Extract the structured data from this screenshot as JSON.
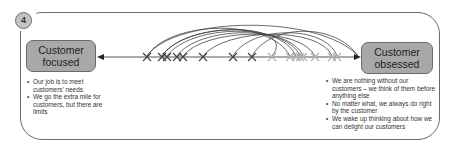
{
  "diagram": {
    "step_number": "4",
    "left_node": {
      "label_line1": "Customer",
      "label_line2": "focused",
      "bullets": [
        "Our job is to meet customers' needs",
        "We go the extra mile for customers, but there are limits"
      ]
    },
    "right_node": {
      "label_line1": "Customer",
      "label_line2": "obsessed",
      "bullets": [
        "We are nothing without our customers – we think of them before anything else",
        "No matter what, we always do right by the customer",
        "We wake up thinking about how we can delight our customers"
      ]
    },
    "colors": {
      "node_fill": "#a8a8a8",
      "frame_stroke": "#6b6b6b",
      "dark_marker": "#333333",
      "light_marker": "#b0b0b0"
    },
    "spectrum": {
      "dark_positions_x": [
        147,
        162,
        167,
        177,
        183,
        203,
        233,
        252
      ],
      "light_positions_x": [
        272,
        290,
        296,
        300,
        303,
        315,
        332,
        337
      ]
    }
  }
}
